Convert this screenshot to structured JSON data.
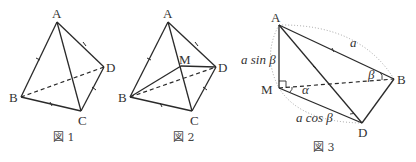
{
  "figure1": {
    "caption": "図 1",
    "points": {
      "A": "A",
      "B": "B",
      "C": "C",
      "D": "D"
    }
  },
  "figure2": {
    "caption": "図 2",
    "points": {
      "A": "A",
      "B": "B",
      "C": "C",
      "D": "D",
      "M": "M"
    }
  },
  "figure3": {
    "caption": "図 3",
    "points": {
      "A": "A",
      "B": "B",
      "D": "D",
      "M": "M"
    },
    "labels": {
      "AM": "a sin β",
      "AB": "a",
      "MD": "a cos β",
      "angle_M": "α",
      "angle_B": "β"
    }
  }
}
